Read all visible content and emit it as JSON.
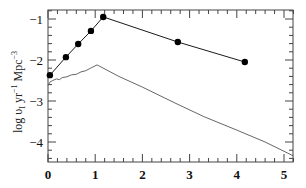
{
  "chart_data": {
    "type": "line",
    "title": "",
    "xlabel": "",
    "ylabel": "log υ_I yr⁻¹ Mpc⁻³",
    "ylabel_parts": {
      "main": "log υ",
      "sub": "I",
      "rest1": " yr",
      "sup1": "−1",
      "rest2": " Mpc",
      "sup2": "−3"
    },
    "xlim": [
      0,
      5.2
    ],
    "ylim": [
      -4.5,
      -0.8
    ],
    "xticks": [
      0,
      1,
      2,
      3,
      4,
      5
    ],
    "xtick_labels": [
      "0",
      "1",
      "2",
      "3",
      "4",
      "5"
    ],
    "yticks": [
      -1,
      -2,
      -3,
      -4
    ],
    "ytick_labels": [
      "−1",
      "−2",
      "−3",
      "−4"
    ],
    "grid": false,
    "legend": null,
    "series": [
      {
        "name": "upper (with markers)",
        "marker": "circle",
        "color": "#000000",
        "x": [
          0.04,
          0.38,
          0.64,
          0.91,
          1.17,
          2.75,
          4.17
        ],
        "y": [
          -2.37,
          -1.93,
          -1.61,
          -1.29,
          -0.95,
          -1.56,
          -2.05
        ]
      },
      {
        "name": "lower (line only)",
        "marker": "none",
        "color": "#555555",
        "x": [
          0.0,
          0.04,
          0.1,
          0.18,
          0.24,
          0.3,
          0.4,
          0.5,
          0.6,
          0.7,
          0.8,
          0.9,
          1.04,
          1.5,
          2.0,
          2.69,
          3.3,
          4.0,
          4.6,
          5.2
        ],
        "y": [
          -2.62,
          -2.54,
          -2.5,
          -2.46,
          -2.48,
          -2.43,
          -2.41,
          -2.36,
          -2.35,
          -2.29,
          -2.26,
          -2.2,
          -2.12,
          -2.4,
          -2.66,
          -3.05,
          -3.38,
          -3.71,
          -4.0,
          -4.34
        ]
      }
    ]
  }
}
